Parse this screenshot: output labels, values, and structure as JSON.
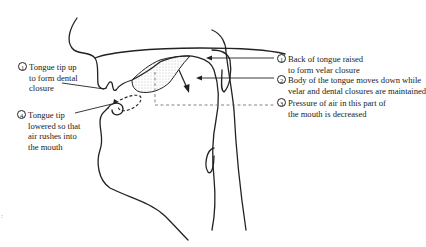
{
  "diagram": {
    "type": "articulatory vocal tract cross-section",
    "colors": {
      "line": "#222222",
      "background": "#ffffff",
      "stipple": "#777777"
    },
    "labels_left": [
      {
        "num": "1",
        "lines": [
          "Tongue tip up",
          "to form dental",
          "closure"
        ]
      },
      {
        "num": "4",
        "lines": [
          "Tongue tip",
          "lowered so that",
          "air rushes into",
          "the mouth"
        ]
      }
    ],
    "labels_right": [
      {
        "num": "1",
        "lines": [
          "Back of tongue raised",
          "to form velar closure"
        ]
      },
      {
        "num": "2",
        "lines": [
          "Body of the tongue  moves down while",
          "velar and dental closures are maintained"
        ]
      },
      {
        "num": "3",
        "lines": [
          "Pressure of air in this part of",
          "the mouth is decreased"
        ]
      }
    ],
    "stray_mark": ":"
  }
}
